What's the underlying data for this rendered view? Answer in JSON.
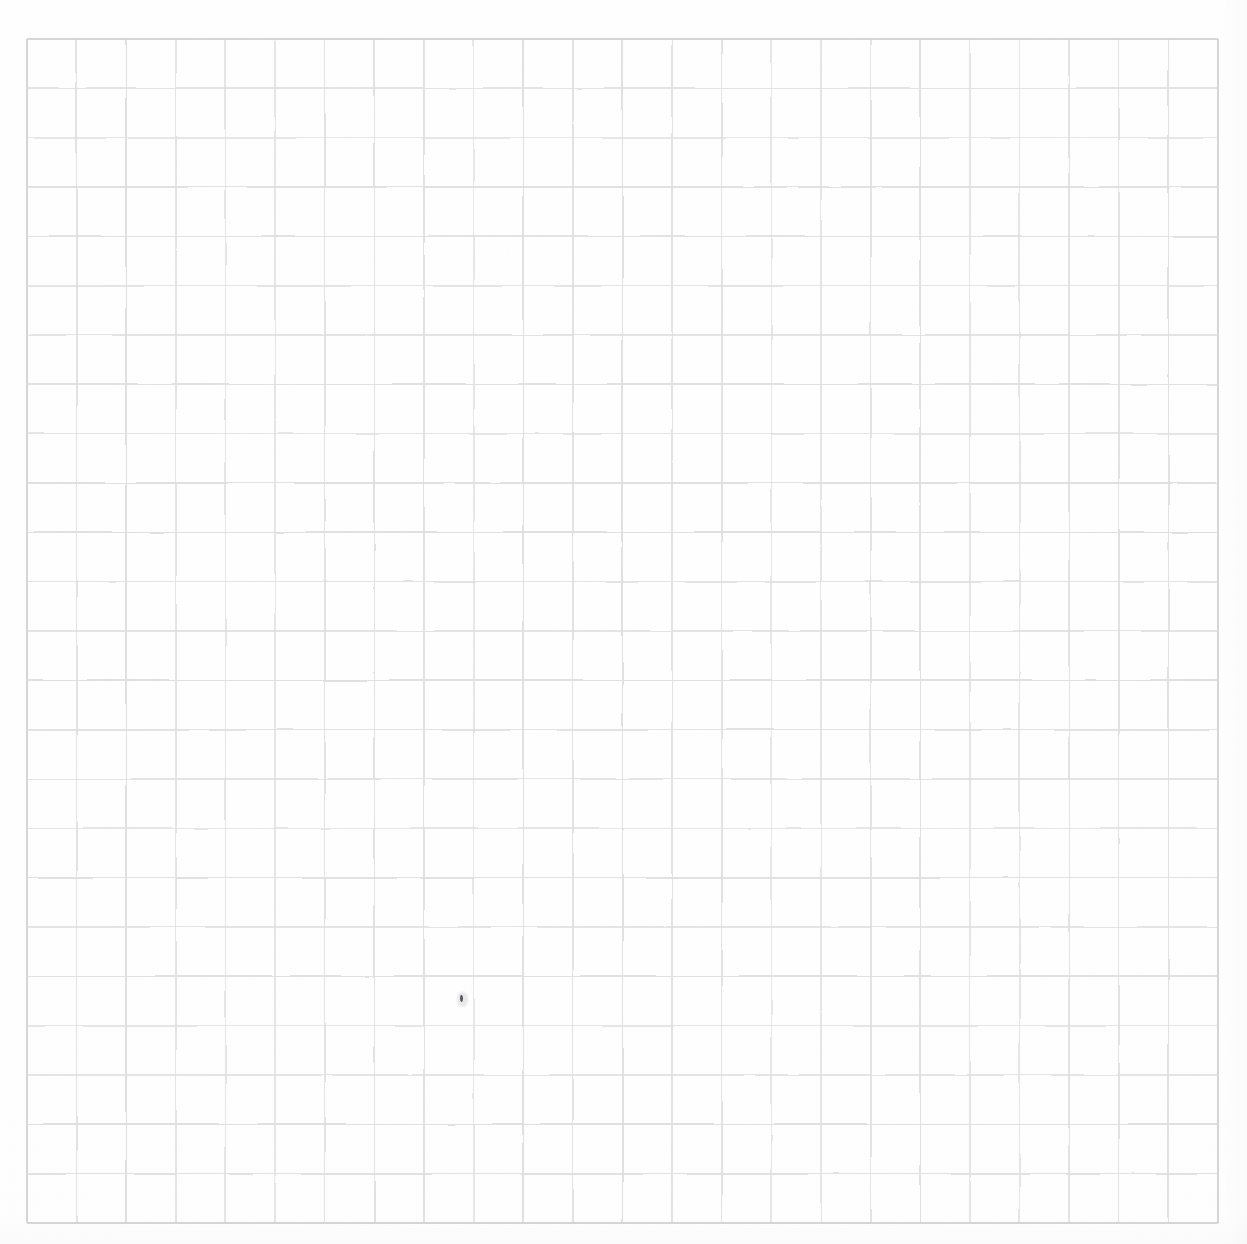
{
  "image": {
    "kind": "scanned-graph-paper",
    "description": "Blank square-ruled graph paper sheet, scanned",
    "width": 1247,
    "height": 1244,
    "background_color": "#ffffff"
  },
  "grid": {
    "name": "graph-paper-grid",
    "left": 27,
    "top": 39,
    "right": 1218,
    "bottom": 1223,
    "width": 1191,
    "height": 1184,
    "columns": 24,
    "rows": 24,
    "cell_width": 49.6,
    "cell_height": 49.3,
    "line_color": "#dedede",
    "line_color_strong": "#d4d4d4",
    "line_width": 1.6,
    "border_line_width": 2.0,
    "subdivisions": 0
  },
  "marks": [
    {
      "name": "pencil-speck",
      "type": "speck",
      "x": 460,
      "y": 995,
      "width": 3,
      "height": 7,
      "color": "#5c5c62"
    }
  ],
  "annotations": {
    "text_present": false,
    "labels": []
  }
}
